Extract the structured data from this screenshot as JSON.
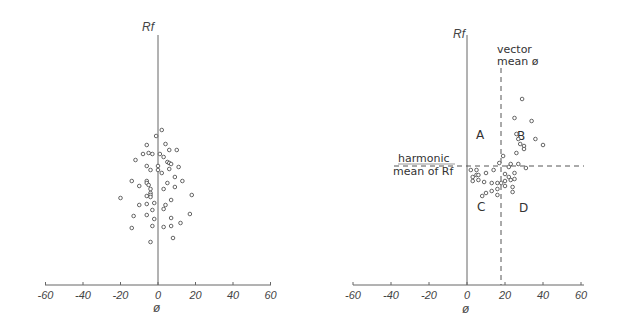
{
  "chart_data": [
    {
      "type": "scatter",
      "title": "",
      "xlabel": "ø",
      "ylabel": "Rf",
      "xlim": [
        -60,
        60
      ],
      "xticks": [
        -60,
        -40,
        -20,
        0,
        20,
        40,
        60
      ],
      "xtick_labels": [
        "-60",
        "-40",
        "-20",
        "0",
        "20",
        "40",
        "60"
      ],
      "grid": false,
      "legend": null,
      "note": "points stored as [phi_degrees, pixel_y]; Rf axis has no numeric ticks",
      "points": [
        [
          2,
          130
        ],
        [
          -1,
          136
        ],
        [
          -6,
          145
        ],
        [
          4,
          144
        ],
        [
          -8,
          154
        ],
        [
          -3,
          154
        ],
        [
          6,
          150
        ],
        [
          10,
          150
        ],
        [
          -12,
          160
        ],
        [
          -5,
          153
        ],
        [
          1,
          154
        ],
        [
          3,
          157
        ],
        [
          5,
          162
        ],
        [
          6,
          163
        ],
        [
          7,
          164
        ],
        [
          11,
          167
        ],
        [
          0,
          166
        ],
        [
          -6,
          166
        ],
        [
          -4,
          170
        ],
        [
          0,
          170
        ],
        [
          6,
          169
        ],
        [
          2,
          173
        ],
        [
          9,
          177
        ],
        [
          -14,
          181
        ],
        [
          -6,
          181
        ],
        [
          -6,
          183
        ],
        [
          -5,
          185
        ],
        [
          5,
          183
        ],
        [
          13,
          181
        ],
        [
          -10,
          186
        ],
        [
          9,
          187
        ],
        [
          -4,
          189
        ],
        [
          3,
          189
        ],
        [
          -4,
          193
        ],
        [
          -4,
          195
        ],
        [
          -4,
          197
        ],
        [
          -6,
          196
        ],
        [
          18,
          195
        ],
        [
          -20,
          198
        ],
        [
          7,
          200
        ],
        [
          -10,
          205
        ],
        [
          -6,
          204
        ],
        [
          -2,
          203
        ],
        [
          4,
          205
        ],
        [
          3,
          209
        ],
        [
          -3,
          210
        ],
        [
          -13,
          216
        ],
        [
          -6,
          215
        ],
        [
          -2,
          219
        ],
        [
          7,
          218
        ],
        [
          17,
          214
        ],
        [
          -14,
          228
        ],
        [
          7,
          226
        ],
        [
          12,
          223
        ],
        [
          -3,
          226
        ],
        [
          3,
          227
        ],
        [
          8,
          238
        ],
        [
          -4,
          242
        ]
      ]
    },
    {
      "type": "scatter",
      "title": "",
      "xlabel": "ø",
      "ylabel": "Rf",
      "xlim": [
        -60,
        60
      ],
      "xticks": [
        -60,
        -40,
        -20,
        0,
        20,
        40,
        60
      ],
      "xtick_labels": [
        "-60",
        "-40",
        "-20",
        "0",
        "20",
        "40",
        "60"
      ],
      "grid": false,
      "legend": null,
      "reference_lines": {
        "vertical": {
          "x": 18,
          "label": "vector mean ø",
          "style": "dashed"
        },
        "horizontal": {
          "pixel_y": 166,
          "label": "harmonic mean of Rf",
          "style": "dashed"
        }
      },
      "quadrants": [
        "A",
        "B",
        "C",
        "D"
      ],
      "points": [
        [
          29,
          99
        ],
        [
          25,
          118
        ],
        [
          34,
          121
        ],
        [
          26,
          134
        ],
        [
          27,
          139
        ],
        [
          36,
          139
        ],
        [
          28,
          144
        ],
        [
          30,
          146
        ],
        [
          40,
          145
        ],
        [
          30,
          149
        ],
        [
          26,
          153
        ],
        [
          19,
          156
        ],
        [
          17,
          163
        ],
        [
          23,
          164
        ],
        [
          27,
          164
        ],
        [
          22,
          167
        ],
        [
          31,
          168
        ],
        [
          2,
          170
        ],
        [
          5,
          170
        ],
        [
          10,
          173
        ],
        [
          14,
          170
        ],
        [
          5,
          175
        ],
        [
          3,
          177
        ],
        [
          6,
          175
        ],
        [
          6,
          180
        ],
        [
          3,
          181
        ],
        [
          9,
          182
        ],
        [
          13,
          183
        ],
        [
          16,
          183
        ],
        [
          18,
          183
        ],
        [
          20,
          181
        ],
        [
          23,
          180
        ],
        [
          25,
          179
        ],
        [
          20,
          174
        ],
        [
          22,
          177
        ],
        [
          25,
          173
        ],
        [
          24,
          187
        ],
        [
          20,
          186
        ],
        [
          16,
          189
        ],
        [
          13,
          191
        ],
        [
          10,
          193
        ],
        [
          8,
          196
        ],
        [
          16,
          195
        ],
        [
          24,
          192
        ]
      ]
    }
  ],
  "left_plot": {
    "y_axis_label": "Rf",
    "x_axis_label": "ø",
    "ticks": [
      "-60",
      "-40",
      "-20",
      "0",
      "20",
      "40",
      "60"
    ]
  },
  "right_plot": {
    "y_axis_label": "Rf",
    "x_axis_label": "ø",
    "ticks": [
      "-60",
      "-40",
      "-20",
      "0",
      "20",
      "40",
      "60"
    ],
    "vector_mean_label": [
      "vector",
      "mean ø"
    ],
    "harmonic_mean_label": [
      "harmonic",
      "mean of Rf"
    ],
    "quadrant_labels": {
      "A": "A",
      "B": "B",
      "C": "C",
      "D": "D"
    }
  }
}
